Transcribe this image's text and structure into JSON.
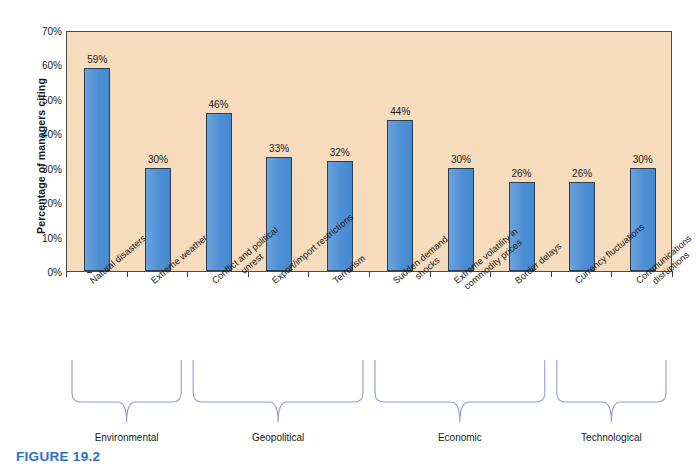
{
  "figure": {
    "caption": "FIGURE 19.2",
    "caption_color": "#2f6fc4"
  },
  "colors": {
    "bar_fill": "#4e8fd4",
    "bar_stroke": "#2d3e50",
    "plot_background": "#f6dcbd",
    "axis": "#4a4a4a",
    "bracket": "#8e9bd4",
    "text": "#1a1a1a"
  },
  "chart_data": {
    "type": "bar",
    "title": "",
    "xlabel": "",
    "ylabel": "Percentage of managers citing",
    "ylim": [
      0,
      70
    ],
    "ytick_labels": [
      "0%",
      "10%",
      "20%",
      "30%",
      "40%",
      "50%",
      "60%",
      "70%"
    ],
    "ytick_values": [
      0,
      10,
      20,
      30,
      40,
      50,
      60,
      70
    ],
    "grid": false,
    "legend": "none",
    "categories": [
      "Natural disasters",
      "Extreme weather",
      "Conflict and political unrest",
      "Export/import restrictions",
      "Terrorism",
      "Sudden demand shocks",
      "Extreme volatility in commodity prices",
      "Border delays",
      "Currency fluctuations",
      "Communications disruptions"
    ],
    "values": [
      59,
      30,
      46,
      33,
      32,
      44,
      30,
      26,
      26,
      30
    ],
    "data_labels": [
      "59%",
      "30%",
      "46%",
      "33%",
      "32%",
      "44%",
      "30%",
      "26%",
      "26%",
      "30%"
    ]
  },
  "category_labels": [
    {
      "lines": [
        "Natural disasters"
      ]
    },
    {
      "lines": [
        "Extreme weather"
      ]
    },
    {
      "lines": [
        "Conflict and political",
        "unrest"
      ]
    },
    {
      "lines": [
        "Export/import restrictions"
      ]
    },
    {
      "lines": [
        "Terrorism"
      ]
    },
    {
      "lines": [
        "Sudden demand",
        "shocks"
      ]
    },
    {
      "lines": [
        "Extreme volatility in",
        "commodity prices"
      ]
    },
    {
      "lines": [
        "Border delays"
      ]
    },
    {
      "lines": [
        "Currency fluctuations"
      ]
    },
    {
      "lines": [
        "Communications",
        "disruptions"
      ]
    }
  ],
  "groups": [
    {
      "label": "Environmental",
      "first": 0,
      "last": 1
    },
    {
      "label": "Geopolitical",
      "first": 2,
      "last": 4
    },
    {
      "label": "Economic",
      "first": 5,
      "last": 7
    },
    {
      "label": "Technological",
      "first": 8,
      "last": 9
    }
  ]
}
